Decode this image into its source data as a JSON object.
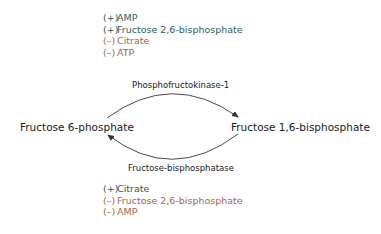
{
  "colors": {
    "activator": "#2f5e56",
    "inhibitor": "#a8664a",
    "text": "#1a1a1a",
    "arrow": "#333333"
  },
  "top_regulators": [
    {
      "sign": "(+)",
      "name": "AMP",
      "effect": "activator"
    },
    {
      "sign": "(+)",
      "name": "Fructose 2,6-bisphosphate",
      "effect": "activator"
    },
    {
      "sign": "(–)",
      "name": "Citrate",
      "effect": "inhibitor"
    },
    {
      "sign": "(–)",
      "name": "ATP",
      "effect": "inhibitor"
    }
  ],
  "bottom_regulators": [
    {
      "sign": "(+)",
      "name": "Citrate",
      "effect": "activator"
    },
    {
      "sign": "(–)",
      "name": "Fructose 2,6-bisphosphate",
      "effect": "inhibitor"
    },
    {
      "sign": "(–)",
      "name": "AMP",
      "effect": "inhibitor"
    }
  ],
  "cycle": {
    "left_metabolite": "Fructose 6-phosphate",
    "right_metabolite": "Fructose 1,6-bisphosphate",
    "forward_enzyme": "Phosphofructokinase-1",
    "reverse_enzyme": "Fructose-bisphosphatase"
  }
}
